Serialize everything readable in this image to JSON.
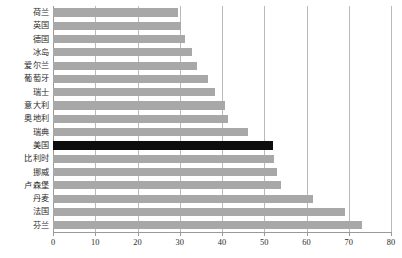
{
  "chart_data": {
    "type": "bar",
    "orientation": "horizontal",
    "title": "",
    "subtitle": "",
    "xlabel": "",
    "ylabel": "",
    "xlim": [
      0,
      80
    ],
    "ylim": null,
    "xticks": [
      0,
      10,
      20,
      30,
      40,
      50,
      60,
      70,
      80
    ],
    "xtick_labels": [
      "0",
      "10",
      "20",
      "30",
      "40",
      "50",
      "60",
      "70",
      "80"
    ],
    "grid": "vertical",
    "legend": null,
    "legend_position": "none",
    "annotations": [],
    "colors": {
      "bar": "#a8a8a8",
      "bar_highlight": "#0d0d0d",
      "gridline": "#b9b9b9",
      "axis": "#9a9a9a",
      "text": "#2b2b2b",
      "background": "#ffffff"
    },
    "highlight_category": "美国",
    "categories": [
      "荷兰",
      "英国",
      "德国",
      "冰岛",
      "爱尔兰",
      "葡萄牙",
      "瑞士",
      "意大利",
      "奥地利",
      "瑞典",
      "美国",
      "比利时",
      "挪威",
      "卢森堡",
      "丹麦",
      "法国",
      "芬兰"
    ],
    "values": [
      29.6,
      30.3,
      31.3,
      33.0,
      34.0,
      36.7,
      38.4,
      40.8,
      41.5,
      46.2,
      52.1,
      52.4,
      53.0,
      54.0,
      61.6,
      69.0,
      73.2
    ],
    "bars": [
      {
        "label": "荷兰",
        "value": 29.6,
        "highlight": false
      },
      {
        "label": "英国",
        "value": 30.3,
        "highlight": false
      },
      {
        "label": "德国",
        "value": 31.3,
        "highlight": false
      },
      {
        "label": "冰岛",
        "value": 33.0,
        "highlight": false
      },
      {
        "label": "爱尔兰",
        "value": 34.0,
        "highlight": false
      },
      {
        "label": "葡萄牙",
        "value": 36.7,
        "highlight": false
      },
      {
        "label": "瑞士",
        "value": 38.4,
        "highlight": false
      },
      {
        "label": "意大利",
        "value": 40.8,
        "highlight": false
      },
      {
        "label": "奥地利",
        "value": 41.5,
        "highlight": false
      },
      {
        "label": "瑞典",
        "value": 46.2,
        "highlight": false
      },
      {
        "label": "美国",
        "value": 52.1,
        "highlight": true
      },
      {
        "label": "比利时",
        "value": 52.4,
        "highlight": false
      },
      {
        "label": "挪威",
        "value": 53.0,
        "highlight": false
      },
      {
        "label": "卢森堡",
        "value": 54.0,
        "highlight": false
      },
      {
        "label": "丹麦",
        "value": 61.6,
        "highlight": false
      },
      {
        "label": "法国",
        "value": 69.0,
        "highlight": false
      },
      {
        "label": "芬兰",
        "value": 73.2,
        "highlight": false
      }
    ]
  }
}
